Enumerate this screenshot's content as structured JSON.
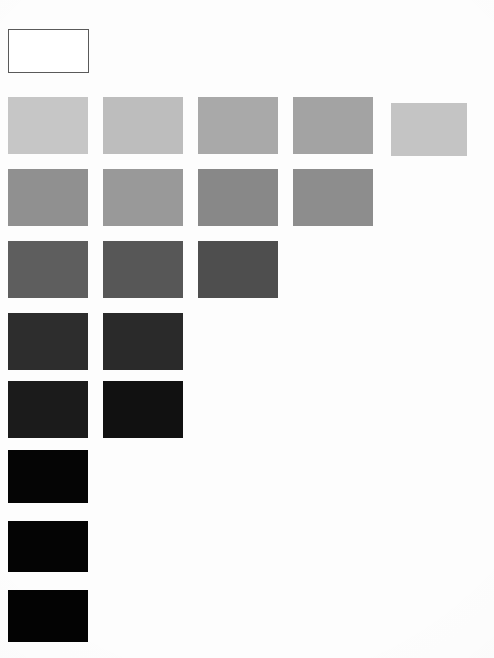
{
  "document": {
    "title": "Grayscale Step Wedge",
    "page_background": "#fdfdfd",
    "width": 494,
    "height": 658
  },
  "reference_patch": {
    "name": "white-reference-box",
    "label": "",
    "fill": "#ffffff",
    "border_color": "#5a5a5a",
    "x": 8,
    "y": 29,
    "width": 81,
    "height": 44
  },
  "chart_data": {
    "type": "heatmap",
    "subtitle": "",
    "xlabel": "",
    "ylabel": "",
    "grid": false,
    "legend_position": "none",
    "swatch_width": 80,
    "swatch_height": 57,
    "column_pitch": 95,
    "row_pitch": 72,
    "origin_x": 8,
    "origin_y": 97,
    "categories": [
      "1",
      "2",
      "3",
      "4",
      "5"
    ],
    "row_labels": [
      "1",
      "2",
      "3",
      "4",
      "5",
      "6",
      "7",
      "8"
    ],
    "counts_per_row": [
      5,
      4,
      3,
      2,
      2,
      1,
      1,
      1
    ],
    "rows": [
      {
        "row": 1,
        "count": 5,
        "cells": [
          {
            "col": 1,
            "color": "#c6c6c6",
            "gray_value": 198,
            "x": 8,
            "y": 97,
            "width": 80,
            "height": 57
          },
          {
            "col": 2,
            "color": "#bdbdbd",
            "gray_value": 189,
            "x": 103,
            "y": 97,
            "width": 80,
            "height": 57
          },
          {
            "col": 3,
            "color": "#a9a9a9",
            "gray_value": 169,
            "x": 198,
            "y": 97,
            "width": 80,
            "height": 57
          },
          {
            "col": 4,
            "color": "#a3a3a3",
            "gray_value": 163,
            "x": 293,
            "y": 97,
            "width": 80,
            "height": 57
          },
          {
            "col": 5,
            "color": "#c4c4c4",
            "gray_value": 196,
            "x": 391,
            "y": 103,
            "width": 76,
            "height": 53
          }
        ]
      },
      {
        "row": 2,
        "count": 4,
        "cells": [
          {
            "col": 1,
            "color": "#909090",
            "gray_value": 144,
            "x": 8,
            "y": 169,
            "width": 80,
            "height": 57
          },
          {
            "col": 2,
            "color": "#999999",
            "gray_value": 153,
            "x": 103,
            "y": 169,
            "width": 80,
            "height": 57
          },
          {
            "col": 3,
            "color": "#888888",
            "gray_value": 136,
            "x": 198,
            "y": 169,
            "width": 80,
            "height": 57
          },
          {
            "col": 4,
            "color": "#8d8d8d",
            "gray_value": 141,
            "x": 293,
            "y": 169,
            "width": 80,
            "height": 57
          }
        ]
      },
      {
        "row": 3,
        "count": 3,
        "cells": [
          {
            "col": 1,
            "color": "#5e5e5e",
            "gray_value": 94,
            "x": 8,
            "y": 241,
            "width": 80,
            "height": 57
          },
          {
            "col": 2,
            "color": "#575757",
            "gray_value": 87,
            "x": 103,
            "y": 241,
            "width": 80,
            "height": 57
          },
          {
            "col": 3,
            "color": "#4e4e4e",
            "gray_value": 78,
            "x": 198,
            "y": 241,
            "width": 80,
            "height": 57
          }
        ]
      },
      {
        "row": 4,
        "count": 2,
        "cells": [
          {
            "col": 1,
            "color": "#2d2d2d",
            "gray_value": 45,
            "x": 8,
            "y": 313,
            "width": 80,
            "height": 57
          },
          {
            "col": 2,
            "color": "#2a2a2a",
            "gray_value": 42,
            "x": 103,
            "y": 313,
            "width": 80,
            "height": 57
          }
        ]
      },
      {
        "row": 5,
        "count": 2,
        "cells": [
          {
            "col": 1,
            "color": "#1b1b1b",
            "gray_value": 27,
            "x": 8,
            "y": 381,
            "width": 80,
            "height": 57
          },
          {
            "col": 2,
            "color": "#111111",
            "gray_value": 17,
            "x": 103,
            "y": 381,
            "width": 80,
            "height": 57
          }
        ]
      },
      {
        "row": 6,
        "count": 1,
        "cells": [
          {
            "col": 1,
            "color": "#050505",
            "gray_value": 5,
            "x": 8,
            "y": 450,
            "width": 80,
            "height": 53
          }
        ]
      },
      {
        "row": 7,
        "count": 1,
        "cells": [
          {
            "col": 1,
            "color": "#040404",
            "gray_value": 4,
            "x": 8,
            "y": 521,
            "width": 80,
            "height": 51
          }
        ]
      },
      {
        "row": 8,
        "count": 1,
        "cells": [
          {
            "col": 1,
            "color": "#030303",
            "gray_value": 3,
            "x": 8,
            "y": 590,
            "width": 80,
            "height": 52
          }
        ]
      }
    ]
  }
}
